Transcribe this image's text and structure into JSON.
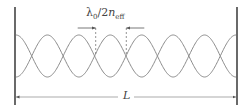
{
  "diagram": {
    "labels": {
      "node_spacing_main": "λ",
      "node_spacing_sub0": "0",
      "node_spacing_mid": "/2",
      "node_spacing_n": "n",
      "node_spacing_sub_eff": "eff",
      "length": "L"
    },
    "geometry": {
      "left_wall_x": 15,
      "right_wall_x": 237,
      "wall_top_y": 7,
      "wall_bottom_y": 105,
      "wave_center_y": 56,
      "wave_amplitude": 21,
      "half_periods": 7,
      "length_arrow_y": 97,
      "spacing_arrow_y": 28,
      "spacing_markers_x": [
        95.7,
        126.3
      ]
    },
    "colors": {
      "wall": "#444444",
      "wave": "#8a8a8a",
      "annotation": "#555555"
    }
  }
}
